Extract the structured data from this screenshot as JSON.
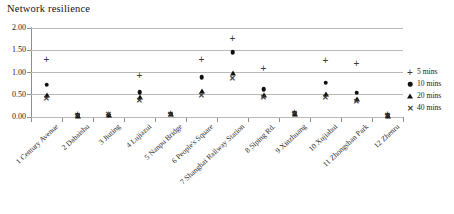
{
  "chart_data": {
    "type": "scatter",
    "title": "Network resilience",
    "xlabel": "",
    "ylabel": "",
    "ylim": [
      0.0,
      2.0
    ],
    "ytick_labels": [
      "0.00",
      "0.50",
      "1.00",
      "1.50",
      "2.00"
    ],
    "ytick_values": [
      0.0,
      0.5,
      1.0,
      1.5,
      2.0
    ],
    "grid": "horizontal",
    "legend_position": "right",
    "categories": [
      "1 Century Avenue",
      "2 Dabaishu",
      "3 Jiuting",
      "4 Lujiazui",
      "5 Nanpu Bridge",
      "6 People's Square",
      "7 Shanghai Railway Station",
      "8 Siping Rd.",
      "9 Xinzhuang",
      "10 Xujiahui",
      "11 Zhongshan Park",
      "12 Zhenru"
    ],
    "series": [
      {
        "name": "5 mins",
        "marker": "plus",
        "values": [
          1.27,
          0.04,
          0.05,
          0.92,
          0.07,
          1.27,
          1.75,
          1.08,
          0.08,
          1.25,
          1.18,
          0.04
        ]
      },
      {
        "name": "10 mins",
        "marker": "circle",
        "values": [
          0.73,
          0.04,
          0.05,
          0.56,
          0.07,
          0.9,
          1.45,
          0.62,
          0.08,
          0.77,
          0.55,
          0.04
        ]
      },
      {
        "name": "20 mins",
        "marker": "triangle",
        "values": [
          0.5,
          0.03,
          0.04,
          0.44,
          0.06,
          0.58,
          1.0,
          0.5,
          0.07,
          0.52,
          0.4,
          0.03
        ]
      },
      {
        "name": "40 mins",
        "marker": "cross",
        "values": [
          0.41,
          0.03,
          0.04,
          0.36,
          0.05,
          0.48,
          0.85,
          0.42,
          0.06,
          0.43,
          0.33,
          0.03
        ]
      }
    ]
  },
  "legend": {
    "items": [
      {
        "label": "5 mins",
        "glyph": "+",
        "icon": "plus-marker-icon"
      },
      {
        "label": "10 mins",
        "glyph": "●",
        "icon": "circle-marker-icon"
      },
      {
        "label": "20 mins",
        "glyph": "▲",
        "icon": "triangle-marker-icon"
      },
      {
        "label": "40 mins",
        "glyph": "✕",
        "icon": "cross-marker-icon"
      }
    ]
  },
  "colors": {
    "marker": "#111111",
    "gridline": "#b9b9b9",
    "axis": "#8d8d8d",
    "text": "#1a1a1a",
    "background": "#ffffff"
  }
}
